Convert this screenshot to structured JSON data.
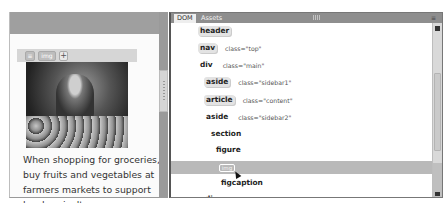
{
  "live_view": {
    "element_hud": {
      "tag_label": "img",
      "add_label": "+"
    },
    "image_alt": "Shopper selecting apples at a farmers market",
    "caption_lines": [
      "When shopping for groceries,",
      "buy fruits and vegetables at",
      "farmers markets to support",
      "local agriculture."
    ]
  },
  "dom_panel": {
    "tabs": [
      {
        "label": "DOM",
        "active": true
      },
      {
        "label": "Assets",
        "active": false
      }
    ],
    "tree": [
      {
        "tag": "header",
        "attr": "",
        "indent": 0
      },
      {
        "tag": "nav",
        "attr": "class=\"top\"",
        "indent": 0
      },
      {
        "tag": "div",
        "attr": "class=\"main\"",
        "indent": 0
      },
      {
        "tag": "aside",
        "attr": "class=\"sidebar1\"",
        "indent": 1
      },
      {
        "tag": "article",
        "attr": "class=\"content\"",
        "indent": 1
      },
      {
        "tag": "aside",
        "attr": "class=\"sidebar2\"",
        "indent": 1
      },
      {
        "tag": "section",
        "attr": "",
        "indent": 2
      },
      {
        "tag": "figure",
        "attr": "",
        "indent": 3
      },
      {
        "tag": "img",
        "attr": "",
        "indent": 4,
        "selected": true,
        "editing": true
      },
      {
        "tag": "figcaption",
        "attr": "",
        "indent": 4
      },
      {
        "tag": "div",
        "attr": "class=\"push\"",
        "indent": 1
      },
      {
        "tag": "footer",
        "attr": "",
        "indent": 0
      }
    ],
    "selected_color": "#b9b9b9"
  }
}
